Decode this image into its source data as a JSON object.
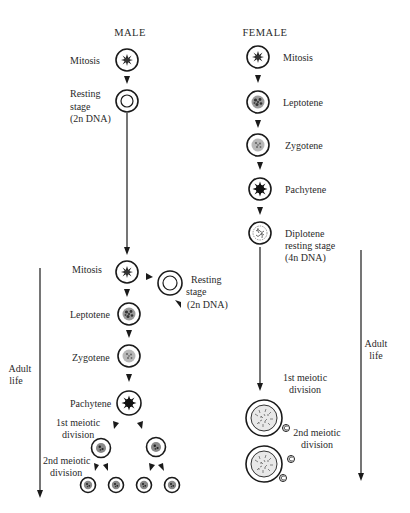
{
  "headers": {
    "male": "MALE",
    "female": "FEMALE"
  },
  "male": {
    "fetal": {
      "mitosis": "Mitosis",
      "resting_line1": "Resting",
      "resting_line2": "stage",
      "resting_line3": "(2n DNA)"
    },
    "adult": {
      "mitosis": "Mitosis",
      "resting_line1": "Resting",
      "resting_line2": "stage",
      "resting_line3": "(2n DNA)",
      "leptotene": "Leptotene",
      "zygotene": "Zygotene",
      "pachytene": "Pachytene",
      "first_div_line1": "1st meiotic",
      "first_div_line2": "division",
      "second_div_line1": "2nd meiotic",
      "second_div_line2": "division"
    },
    "adult_life_line1": "Adult",
    "adult_life_line2": "life"
  },
  "female": {
    "mitosis": "Mitosis",
    "leptotene": "Leptotene",
    "zygotene": "Zygotene",
    "pachytene": "Pachytene",
    "diplotene_line1": "Diplotene",
    "diplotene_line2": "resting stage",
    "diplotene_line3": "(4n DNA)",
    "first_div_line1": "1st meiotic",
    "first_div_line2": "division",
    "second_div_line1": "2nd meiotic",
    "second_div_line2": "division",
    "adult_life_line1": "Adult",
    "adult_life_line2": "life"
  },
  "colors": {
    "ink": "#1a1a1a",
    "text": "#2a2a2a",
    "background": "#ffffff",
    "nucleus_fill": "#8a8a8a"
  }
}
